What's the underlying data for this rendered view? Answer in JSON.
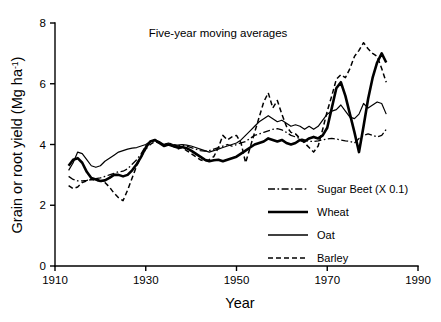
{
  "chart_data": {
    "type": "line",
    "title": "Five-year moving averages",
    "xlabel": "Year",
    "ylabel": "Grain or root yield (Mg ha-1)",
    "ylabel_main": "Grain or root yield (Mg ha",
    "ylabel_sup": "-1",
    "ylabel_tail": ")",
    "xlim": [
      1910,
      1990
    ],
    "ylim": [
      0,
      8
    ],
    "xticks": [
      1910,
      1930,
      1950,
      1970,
      1990
    ],
    "yticks": [
      0,
      2,
      4,
      6,
      8
    ],
    "xtick_labels": [
      "1910",
      "1930",
      "1950",
      "1970",
      "1990"
    ],
    "ytick_labels": [
      "0",
      "2",
      "4",
      "6",
      "8"
    ],
    "grid": false,
    "legend_position": "center-right",
    "series": [
      {
        "name": "Sugar Beet (X 0.1)",
        "style": "dashdot",
        "width": 1.3,
        "x": [
          1913,
          1914,
          1915,
          1916,
          1917,
          1918,
          1919,
          1920,
          1921,
          1922,
          1923,
          1924,
          1925,
          1926,
          1927,
          1928,
          1929,
          1930,
          1931,
          1932,
          1933,
          1934,
          1935,
          1936,
          1937,
          1938,
          1939,
          1940,
          1941,
          1942,
          1943,
          1944,
          1945,
          1946,
          1947,
          1948,
          1949,
          1950,
          1951,
          1952,
          1953,
          1954,
          1955,
          1956,
          1957,
          1958,
          1959,
          1960,
          1961,
          1962,
          1963,
          1964,
          1965,
          1966,
          1967,
          1968,
          1969,
          1970,
          1971,
          1972,
          1973,
          1974,
          1975,
          1976,
          1977,
          1978,
          1979,
          1980,
          1981,
          1982,
          1983
        ],
        "y": [
          2.95,
          2.85,
          2.8,
          2.8,
          2.82,
          2.85,
          2.88,
          2.9,
          2.95,
          3.0,
          3.05,
          3.1,
          3.12,
          3.2,
          3.35,
          3.5,
          3.7,
          3.95,
          4.1,
          4.12,
          4.05,
          4.0,
          4.05,
          4.0,
          3.95,
          3.98,
          3.95,
          3.9,
          3.85,
          3.8,
          3.78,
          3.8,
          3.85,
          3.9,
          3.95,
          4.0,
          3.95,
          4.0,
          4.05,
          4.1,
          4.2,
          4.3,
          4.35,
          4.4,
          4.45,
          4.5,
          4.52,
          4.48,
          4.4,
          4.3,
          4.25,
          4.2,
          4.15,
          4.1,
          4.1,
          4.12,
          4.15,
          4.18,
          4.2,
          4.18,
          4.15,
          4.12,
          4.1,
          4.05,
          4.2,
          4.3,
          4.35,
          4.3,
          4.25,
          4.3,
          4.5
        ]
      },
      {
        "name": "Wheat",
        "style": "solid",
        "width": 2.6,
        "x": [
          1913,
          1914,
          1915,
          1916,
          1917,
          1918,
          1919,
          1920,
          1921,
          1922,
          1923,
          1924,
          1925,
          1926,
          1927,
          1928,
          1929,
          1930,
          1931,
          1932,
          1933,
          1934,
          1935,
          1936,
          1937,
          1938,
          1939,
          1940,
          1941,
          1942,
          1943,
          1944,
          1945,
          1946,
          1947,
          1948,
          1949,
          1950,
          1951,
          1952,
          1953,
          1954,
          1955,
          1956,
          1957,
          1958,
          1959,
          1960,
          1961,
          1962,
          1963,
          1964,
          1965,
          1966,
          1967,
          1968,
          1969,
          1970,
          1971,
          1972,
          1973,
          1974,
          1975,
          1976,
          1977,
          1978,
          1979,
          1980,
          1981,
          1982,
          1983
        ],
        "y": [
          3.3,
          3.5,
          3.55,
          3.4,
          3.1,
          2.9,
          2.85,
          2.8,
          2.82,
          2.9,
          3.0,
          3.0,
          2.95,
          3.0,
          3.15,
          3.35,
          3.6,
          3.9,
          4.1,
          4.15,
          4.05,
          3.95,
          4.0,
          3.95,
          3.9,
          3.92,
          3.88,
          3.8,
          3.7,
          3.6,
          3.5,
          3.45,
          3.48,
          3.5,
          3.45,
          3.5,
          3.55,
          3.6,
          3.7,
          3.8,
          3.9,
          4.0,
          4.05,
          4.1,
          4.2,
          4.15,
          4.1,
          4.15,
          4.05,
          4.0,
          4.05,
          4.15,
          4.1,
          4.2,
          4.25,
          4.2,
          4.3,
          4.55,
          5.2,
          5.85,
          6.05,
          5.6,
          5.0,
          4.4,
          3.75,
          4.6,
          5.5,
          6.2,
          6.7,
          7.0,
          6.7
        ]
      },
      {
        "name": "Oat",
        "style": "solid",
        "width": 1.2,
        "x": [
          1913,
          1914,
          1915,
          1916,
          1917,
          1918,
          1919,
          1920,
          1921,
          1922,
          1923,
          1924,
          1925,
          1926,
          1927,
          1928,
          1929,
          1930,
          1931,
          1932,
          1933,
          1934,
          1935,
          1936,
          1937,
          1938,
          1939,
          1940,
          1941,
          1942,
          1943,
          1944,
          1945,
          1946,
          1947,
          1948,
          1949,
          1950,
          1951,
          1952,
          1953,
          1954,
          1955,
          1956,
          1957,
          1958,
          1959,
          1960,
          1961,
          1962,
          1963,
          1964,
          1965,
          1966,
          1967,
          1968,
          1969,
          1970,
          1971,
          1972,
          1973,
          1974,
          1975,
          1976,
          1977,
          1978,
          1979,
          1980,
          1981,
          1982,
          1983
        ],
        "y": [
          3.15,
          3.4,
          3.75,
          3.7,
          3.5,
          3.3,
          3.25,
          3.3,
          3.45,
          3.55,
          3.65,
          3.75,
          3.8,
          3.85,
          3.88,
          3.9,
          3.95,
          4.0,
          4.1,
          4.15,
          4.1,
          4.0,
          4.05,
          4.0,
          3.98,
          4.0,
          3.98,
          3.95,
          3.9,
          3.85,
          3.8,
          3.75,
          3.8,
          3.85,
          3.9,
          3.95,
          4.0,
          4.05,
          4.15,
          4.3,
          4.45,
          4.6,
          4.75,
          4.85,
          4.95,
          4.85,
          4.75,
          4.8,
          4.7,
          4.6,
          4.65,
          4.6,
          4.5,
          4.6,
          4.5,
          4.6,
          4.8,
          5.0,
          5.1,
          5.15,
          5.3,
          5.1,
          4.9,
          4.85,
          5.0,
          5.35,
          5.2,
          5.3,
          5.4,
          5.35,
          5.0
        ]
      },
      {
        "name": "Barley",
        "style": "dashed",
        "width": 1.5,
        "x": [
          1913,
          1914,
          1915,
          1916,
          1917,
          1918,
          1919,
          1920,
          1921,
          1922,
          1923,
          1924,
          1925,
          1926,
          1927,
          1928,
          1929,
          1930,
          1931,
          1932,
          1933,
          1934,
          1935,
          1936,
          1937,
          1938,
          1939,
          1940,
          1941,
          1942,
          1943,
          1944,
          1945,
          1946,
          1947,
          1948,
          1949,
          1950,
          1951,
          1952,
          1953,
          1954,
          1955,
          1956,
          1957,
          1958,
          1959,
          1960,
          1961,
          1962,
          1963,
          1964,
          1965,
          1966,
          1967,
          1968,
          1969,
          1970,
          1971,
          1972,
          1973,
          1974,
          1975,
          1976,
          1977,
          1978,
          1979,
          1980,
          1981,
          1982,
          1983
        ],
        "y": [
          2.65,
          2.55,
          2.6,
          2.75,
          2.8,
          2.85,
          2.82,
          2.8,
          2.75,
          2.6,
          2.4,
          2.25,
          2.15,
          2.5,
          2.9,
          3.3,
          3.6,
          3.85,
          4.0,
          4.1,
          4.05,
          3.95,
          4.0,
          3.95,
          3.85,
          3.9,
          3.8,
          3.7,
          3.6,
          3.5,
          3.45,
          3.5,
          3.6,
          3.9,
          4.3,
          4.15,
          4.25,
          4.3,
          4.05,
          3.4,
          3.9,
          4.4,
          4.9,
          5.4,
          5.7,
          5.2,
          5.45,
          5.0,
          4.6,
          4.4,
          4.35,
          4.2,
          4.05,
          3.9,
          3.75,
          3.95,
          4.5,
          5.1,
          5.6,
          6.15,
          6.3,
          6.2,
          6.5,
          6.9,
          7.1,
          7.35,
          7.15,
          7.0,
          6.9,
          6.5,
          6.05
        ]
      }
    ]
  },
  "legend": {
    "items": [
      {
        "label": "Sugar Beet (X 0.1)",
        "style": "dashdot"
      },
      {
        "label": "Wheat",
        "style": "solid-thick"
      },
      {
        "label": "Oat",
        "style": "solid-thin"
      },
      {
        "label": "Barley",
        "style": "dashed"
      }
    ]
  },
  "colors": {
    "ink": "#000000",
    "background": "#ffffff"
  }
}
